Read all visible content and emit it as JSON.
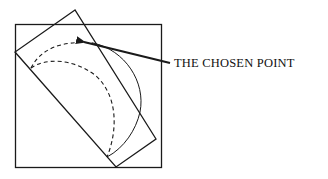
{
  "diagram": {
    "label": "THE CHOSEN POINT",
    "colors": {
      "stroke": "#1a1a1a",
      "background": "#ffffff"
    },
    "elements": {
      "outer_square": "square frame",
      "rotated_rectangle": "tilted rectangle",
      "outer_dashed_arc": "dashed arc through chosen point",
      "inner_dashed_arc": "inner dashed arc",
      "solid_arc": "solid arc continuation",
      "arrow": "arrow pointing to chosen point"
    }
  }
}
